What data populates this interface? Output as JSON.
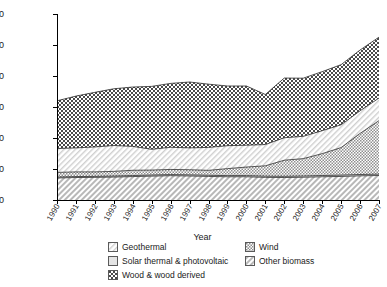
{
  "chart_data": {
    "type": "area",
    "title": "",
    "xlabel": "Year",
    "ylabel": "Millions of kWh",
    "grid": false,
    "legend_position": "bottom",
    "stacked": true,
    "ylim": [
      0,
      120000
    ],
    "ytick_labels": [
      "120,000",
      "100,000",
      "80,000",
      "60,000",
      "40,000",
      "20,000",
      "0"
    ],
    "ytick_values": [
      120000,
      100000,
      80000,
      60000,
      40000,
      20000,
      0
    ],
    "categories": [
      "1990",
      "1991",
      "1992",
      "1993",
      "1994",
      "1995",
      "1996",
      "1997",
      "1998",
      "1999",
      "2000",
      "2001",
      "2002",
      "2003",
      "2004",
      "2005",
      "2006",
      "2007"
    ],
    "series": [
      {
        "name": "Other biomass",
        "pattern": "diagonal-hatch",
        "values": [
          14200,
          14500,
          14600,
          14800,
          15100,
          15400,
          15700,
          15500,
          15200,
          15000,
          15000,
          14600,
          14500,
          14700,
          15000,
          15200,
          15600,
          15800
        ]
      },
      {
        "name": "Solar thermal & photovoltaic",
        "pattern": "solid-light",
        "values": [
          600,
          620,
          640,
          660,
          680,
          700,
          710,
          720,
          730,
          740,
          750,
          760,
          770,
          780,
          800,
          820,
          850,
          880
        ]
      },
      {
        "name": "Wind",
        "pattern": "checkerboard-fine",
        "values": [
          3000,
          3000,
          2900,
          3000,
          3400,
          3200,
          3300,
          3300,
          3200,
          4500,
          5500,
          6700,
          10400,
          11200,
          14100,
          17800,
          26500,
          34500
        ]
      },
      {
        "name": "Geothermal",
        "pattern": "diagonal-hatch-light",
        "values": [
          15400,
          15500,
          16100,
          16700,
          15400,
          13400,
          14300,
          14100,
          14800,
          14800,
          14100,
          13700,
          14500,
          14400,
          14800,
          14700,
          14600,
          14600
        ]
      },
      {
        "name": "Wood & wood derived",
        "pattern": "checkerboard-bold",
        "values": [
          30800,
          33400,
          35200,
          36600,
          38300,
          40600,
          41200,
          42500,
          40800,
          38500,
          38200,
          32300,
          38500,
          37500,
          38100,
          38800,
          39200,
          39300
        ]
      }
    ]
  },
  "legend": {
    "items": [
      {
        "label": "Geothermal",
        "swatch": "geothermal-swatch"
      },
      {
        "label": "Wind",
        "swatch": "wind-swatch"
      },
      {
        "label": "Solar thermal & photovoltaic",
        "swatch": "solar-swatch"
      },
      {
        "label": "Other biomass",
        "swatch": "other-biomass-swatch"
      },
      {
        "label": "Wood & wood derived",
        "swatch": "wood-swatch"
      }
    ]
  }
}
